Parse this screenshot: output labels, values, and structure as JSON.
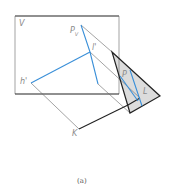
{
  "diagram": {
    "labels": {
      "V": "V",
      "Pv": "P",
      "Pv_sub": "V",
      "l_prime": "l'",
      "h_prime": "h'",
      "K": "K",
      "P": "P",
      "L": "L"
    },
    "caption": "(a)",
    "colors": {
      "frame": "#1a1a1a",
      "thin_line": "#555555",
      "blue_line": "#3a8fd8",
      "triangle_fill": "#d9d9d9"
    }
  }
}
